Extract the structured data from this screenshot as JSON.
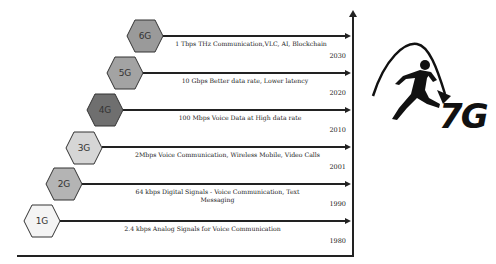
{
  "diagram": {
    "generations": [
      {
        "label": "6G",
        "description": "1 Tbps THz Communication,VLC, AI, Blockchain",
        "year": "2030",
        "fill": "#9a9a9a"
      },
      {
        "label": "5G",
        "description": "10 Gbps Better data rate, Lower latency",
        "year": "2020",
        "fill": "#a3a3a3"
      },
      {
        "label": "4G",
        "description": "100 Mbps Voice Data at High data rate",
        "year": "2010",
        "fill": "#6f6f6f"
      },
      {
        "label": "3G",
        "description": "2Mbps Voice Communication, Wireless Mobile, Video Calls",
        "year": "2001",
        "fill": "#d6d6d6"
      },
      {
        "label": "2G",
        "description": "64 kbps Digital Signals - Voice Communication, Text Messaging",
        "description_line1": "64 kbps Digital Signals - Voice Communication, Text",
        "description_line2": "Messaging",
        "year": "1990",
        "fill": "#b4b4b4"
      },
      {
        "label": "1G",
        "description": "2.4 kbps Analog Signals for Voice Communication",
        "year": "1980",
        "fill": "#f4f4f4"
      }
    ],
    "logo": {
      "text": "7G",
      "icon": "leaping-person-arc-arrow-icon"
    }
  }
}
